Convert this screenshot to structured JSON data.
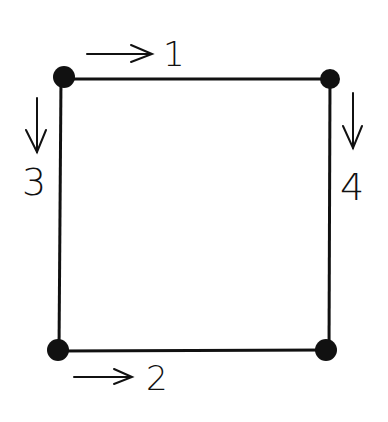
{
  "diagram": {
    "type": "square-graph",
    "colors": {
      "stroke": "#111111",
      "node": "#111111",
      "background": "#ffffff"
    },
    "nodes": [
      {
        "id": "top-left",
        "x": 64,
        "y": 78
      },
      {
        "id": "top-right",
        "x": 330,
        "y": 79
      },
      {
        "id": "bottom-left",
        "x": 58,
        "y": 350
      },
      {
        "id": "bottom-right",
        "x": 326,
        "y": 350
      }
    ],
    "edges": [
      {
        "id": "1",
        "label": "1",
        "from": "top-left",
        "to": "top-right",
        "direction": "right"
      },
      {
        "id": "2",
        "label": "2",
        "from": "bottom-left",
        "to": "bottom-right",
        "direction": "right"
      },
      {
        "id": "3",
        "label": "3",
        "from": "top-left",
        "to": "bottom-left",
        "direction": "down"
      },
      {
        "id": "4",
        "label": "4",
        "from": "top-right",
        "to": "bottom-right",
        "direction": "down"
      }
    ]
  }
}
